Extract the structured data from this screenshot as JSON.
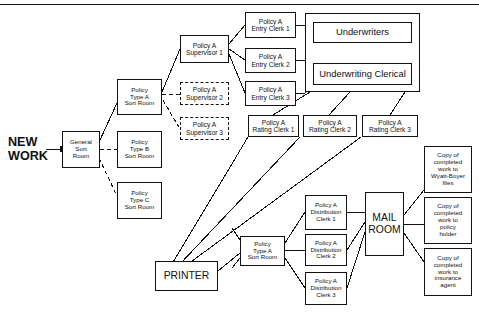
{
  "diagram": {
    "title_rule": true,
    "input_label": "NEW\nWORK",
    "nodes": {
      "general_sort_room": "General\nSort\nRoom",
      "policy_type_a_sort_room": "Policy\nType A\nSort Room",
      "policy_type_b_sort_room": "Policy\nType B\nSort Room",
      "policy_type_c_sort_room": "Policy\nType C\nSort Room",
      "supervisor_1": "Policy A\nSupervisor 1",
      "supervisor_2": "Policy A\nSupervisor 2",
      "supervisor_3": "Policy A\nSupervisor 3",
      "entry_clerk_1": "Policy A\nEntry Clerk 1",
      "entry_clerk_2": "Policy A\nEntry Clerk 2",
      "entry_clerk_3": "Policy A\nEntry Clerk 3",
      "underwriting_group": "",
      "underwriters": "Underwriters",
      "underwriting_clerical": "Underwriting Clerical",
      "rating_clerk_1": "Policy A\nRating Clerk 1",
      "rating_clerk_2": "Policy A\nRating Clerk 2",
      "rating_clerk_3": "Policy A\nRating Clerk 3",
      "printer": "PRINTER",
      "policy_type_a_sort_room_2": "Policy\nType A\nSort Room",
      "distribution_clerk_1": "Policy A\nDistribution\nClerk 1",
      "distribution_clerk_2": "Policy A\nDistribution\nClerk 2",
      "distribution_clerk_3": "Policy A\nDistribution\nClerk 3",
      "mail_room": "MAIL\nROOM",
      "copy_wyatt_boyer": "Copy of\ncompleted\nwork to\nWyatt-Boyer\nfiles",
      "copy_policy_holder": "Copy of\ncompleted\nwork to\npolicy\nholder",
      "copy_insurance_agent": "Copy of\ncompleted\nwork to\ninsurance\nagent"
    },
    "colors": {
      "line": "#111111",
      "background": "#ffffff"
    }
  }
}
